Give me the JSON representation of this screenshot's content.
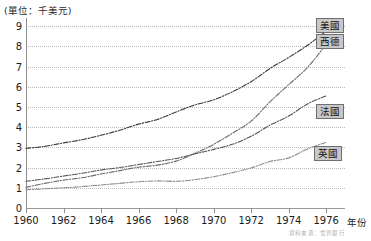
{
  "chart_data": {
    "type": "line",
    "title": "",
    "unit_caption": "(單位：千美元)",
    "xlabel": "年份",
    "ylabel": "",
    "xlim": [
      1960,
      1977
    ],
    "ylim": [
      0,
      9.4
    ],
    "grid": true,
    "legend_position": "right-inline-boxes",
    "x": [
      1960,
      1961,
      1962,
      1963,
      1964,
      1965,
      1966,
      1967,
      1968,
      1969,
      1970,
      1971,
      1972,
      1973,
      1974,
      1975,
      1976
    ],
    "x_tick_labels": [
      "1960",
      "1962",
      "1964",
      "1966",
      "1968",
      "1970",
      "1972",
      "1974",
      "1976"
    ],
    "x_ticks": [
      1960,
      1962,
      1964,
      1966,
      1968,
      1970,
      1972,
      1974,
      1976
    ],
    "y_ticks": [
      0,
      1,
      2,
      3,
      4,
      5,
      6,
      7,
      8,
      9
    ],
    "y_tick_labels": [
      "0",
      "1",
      "2",
      "3",
      "4",
      "5",
      "6",
      "7",
      "8",
      "9"
    ],
    "series": [
      {
        "name": "美國",
        "label": "美國",
        "style": "dash-dot",
        "color": "#3a3a3a",
        "values": [
          2.95,
          3.05,
          3.22,
          3.38,
          3.6,
          3.85,
          4.15,
          4.38,
          4.75,
          5.1,
          5.35,
          5.75,
          6.25,
          6.9,
          7.45,
          8.05,
          8.75
        ]
      },
      {
        "name": "西德",
        "label": "西德",
        "style": "dash-dot",
        "color": "#6b6b6b",
        "values": [
          1.02,
          1.22,
          1.38,
          1.5,
          1.68,
          1.85,
          2.02,
          2.12,
          2.32,
          2.7,
          3.15,
          3.7,
          4.3,
          5.25,
          6.1,
          6.95,
          8.1
        ]
      },
      {
        "name": "法國",
        "label": "法國",
        "style": "dash-dot",
        "color": "#555555",
        "values": [
          1.32,
          1.44,
          1.58,
          1.72,
          1.88,
          2.0,
          2.15,
          2.3,
          2.45,
          2.68,
          2.9,
          3.15,
          3.55,
          4.1,
          4.55,
          5.15,
          5.55
        ]
      },
      {
        "name": "英國",
        "label": "英國",
        "style": "dash-dot",
        "color": "#8a8a8a",
        "values": [
          0.9,
          0.95,
          1.0,
          1.06,
          1.14,
          1.22,
          1.3,
          1.34,
          1.32,
          1.4,
          1.55,
          1.75,
          1.98,
          2.3,
          2.48,
          2.92,
          3.25
        ]
      }
    ]
  },
  "labels": {
    "usa": "美國",
    "west_germany": "西德",
    "france": "法國",
    "uk": "英國"
  },
  "footer": {
    "source_note": "資料來源：世界銀行"
  }
}
